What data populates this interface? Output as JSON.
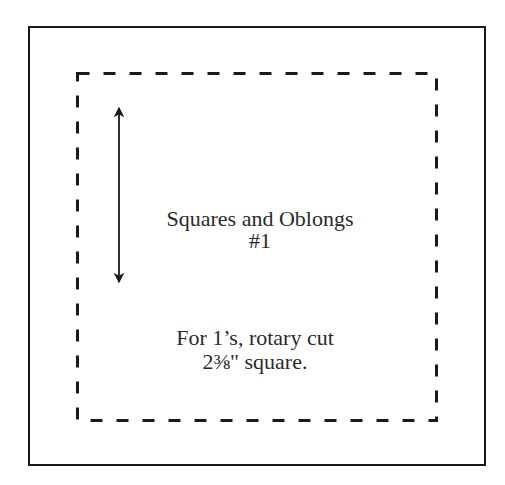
{
  "diagram": {
    "type": "quilt-template",
    "colors": {
      "line": "#1a1a1a",
      "text": "#2a2a2a",
      "background": "#ffffff"
    },
    "outer_square": {
      "x": 29,
      "y": 27,
      "width": 456,
      "height": 438
    },
    "seam_line": {
      "x": 77,
      "y": 73,
      "width": 359,
      "height": 347,
      "style": "dashed"
    },
    "grain_arrow": {
      "x": 119,
      "y1": 108,
      "y2": 282,
      "direction": "vertical-double"
    },
    "title": {
      "line1": "Squares and Oblongs",
      "line2": "#1"
    },
    "instruction": {
      "line1": "For 1’s, rotary cut",
      "line2": "2⅜\" square."
    }
  }
}
